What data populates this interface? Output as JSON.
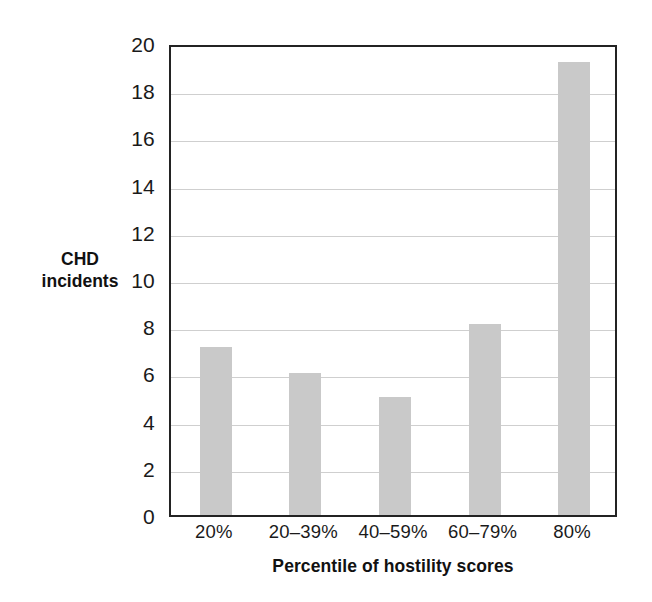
{
  "chart_data": {
    "type": "bar",
    "title": "",
    "subtitle": "",
    "categories": [
      "20%",
      "20–39%",
      "40–59%",
      "60–79%",
      "80%"
    ],
    "values": [
      7.1,
      6.0,
      5.0,
      8.1,
      19.2
    ],
    "series": [
      {
        "name": "CHD incidents",
        "values": [
          7.1,
          6.0,
          5.0,
          8.1,
          19.2
        ]
      }
    ],
    "xlabel": "Percentile of hostility scores",
    "ylabel": "CHD incidents",
    "ylabel_line1": "CHD",
    "ylabel_line2": "incidents",
    "ylim": [
      0,
      20
    ],
    "ytick_step": 2,
    "yticks": [
      0,
      2,
      4,
      6,
      8,
      10,
      12,
      14,
      16,
      18,
      20
    ],
    "ytick_labels": [
      "0",
      "2",
      "4",
      "6",
      "8",
      "10",
      "12",
      "14",
      "16",
      "18",
      "20"
    ],
    "grid": true,
    "grid_axis": "y",
    "legend": false,
    "legend_position": "none",
    "bar_color": "#c9c9c9",
    "grid_color": "#cfcfcf",
    "frame_color": "#232323",
    "background_color": "#ffffff",
    "text_color": "#1a1a1a"
  }
}
